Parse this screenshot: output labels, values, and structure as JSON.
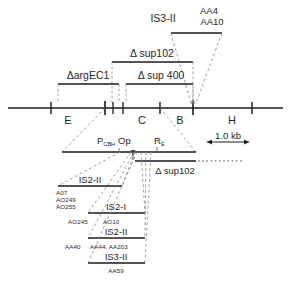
{
  "figure": {
    "colors": {
      "line": "#1a1a1a",
      "dashed": "#6b6b6b",
      "text": "#1f1f1f",
      "background": "#ffffff"
    }
  },
  "top_annotations": {
    "is3_label": "IS3-II",
    "aa_upper": "AA4",
    "aa_lower": "AA10"
  },
  "deletions": {
    "sup102": "Δ sup102",
    "argEC1": "ΔargEC1",
    "sup400": "Δ sup 400",
    "sup102_lower": "Δ sup102"
  },
  "restriction_map": {
    "site_labels": [
      "E",
      "C",
      "B",
      "H"
    ],
    "tick_count": 7
  },
  "operon": {
    "promoter": "P",
    "promoter_sub": "CBH",
    "operator": "Op",
    "regulator": "R",
    "regulator_sub": "E"
  },
  "scale_bar": {
    "label": "1.0 kb"
  },
  "insertion_rows": [
    {
      "name": "IS2-II",
      "alleles": [
        "A07",
        "AO249",
        "AO255"
      ],
      "allele_position": "left"
    },
    {
      "name": "IS2-I",
      "alleles": [
        "AO245",
        "AO10"
      ],
      "allele_position": "below"
    },
    {
      "name": "IS2-II",
      "alleles": [
        "AA40",
        "AA44, AA203"
      ],
      "allele_position": "below"
    },
    {
      "name": "IS3-II",
      "alleles": [
        "AA59"
      ],
      "allele_position": "below-center"
    }
  ]
}
